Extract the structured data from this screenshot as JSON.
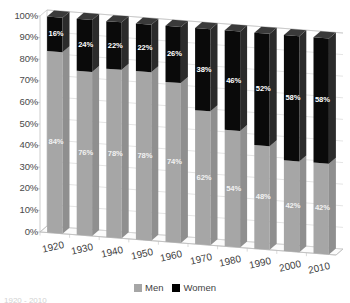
{
  "chart_data": {
    "type": "bar",
    "subtype": "stacked-100-percent-3d",
    "title": "",
    "subtitle": "",
    "xlabel": "",
    "ylabel": "",
    "categories": [
      "1920",
      "1930",
      "1940",
      "1950",
      "1960",
      "1970",
      "1980",
      "1990",
      "2000",
      "2010"
    ],
    "series": [
      {
        "name": "Men",
        "color": "#a6a6a6",
        "values": [
          84,
          76,
          78,
          78,
          74,
          62,
          54,
          48,
          42,
          42
        ],
        "labels": [
          "84%",
          "76%",
          "78%",
          "78%",
          "74%",
          "62%",
          "54%",
          "48%",
          "42%",
          "42%"
        ]
      },
      {
        "name": "Women",
        "color": "#000000",
        "values": [
          16,
          24,
          22,
          22,
          26,
          38,
          46,
          52,
          58,
          58
        ],
        "labels": [
          "16%",
          "24%",
          "22%",
          "22%",
          "26%",
          "38%",
          "46%",
          "52%",
          "58%",
          "58%"
        ]
      }
    ],
    "ylim": [
      0,
      100
    ],
    "ytick_values": [
      0,
      10,
      20,
      30,
      40,
      50,
      60,
      70,
      80,
      90,
      100
    ],
    "ytick_labels": [
      "0%",
      "10%",
      "20%",
      "30%",
      "40%",
      "50%",
      "60%",
      "70%",
      "80%",
      "90%",
      "100%"
    ],
    "grid": true,
    "legend_position": "bottom",
    "legend_entries": [
      "Men",
      "Women"
    ]
  },
  "legend": {
    "items": [
      {
        "label": "Men",
        "color": "#a6a6a6"
      },
      {
        "label": "Women",
        "color": "#000000"
      }
    ]
  },
  "caption": {
    "text": "1920 - 2010"
  },
  "style": {
    "men_color": "#a6a6a6",
    "men_side_color": "#8f8f8f",
    "men_top_color": "#bdbdbd",
    "women_color": "#0a0a0a",
    "women_side_color": "#2b2b2b",
    "women_top_color": "#3a3a3a",
    "grid_color": "#d9d9d9",
    "axis_color": "#bfbfbf",
    "floor_color": "#fbfbfb",
    "text_color": "#3f3f3f"
  }
}
